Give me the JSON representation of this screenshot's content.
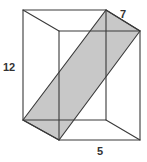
{
  "figure": {
    "colors": {
      "background": "#ffffff",
      "edge": "#3a3a3a",
      "plane_fill": "#c8c8c8",
      "label": "#333333"
    },
    "vertices": {
      "back_top_left": [
        23,
        10
      ],
      "back_top_right": [
        106,
        10
      ],
      "front_top_left": [
        59,
        31
      ],
      "front_top_right": [
        140,
        31
      ],
      "back_bottom_left": [
        23,
        120
      ],
      "back_bottom_right": [
        106,
        120
      ],
      "front_bottom_left": [
        59,
        140
      ],
      "front_bottom_right": [
        140,
        140
      ]
    },
    "labels": {
      "depth": "7",
      "height": "12",
      "width": "5"
    }
  }
}
